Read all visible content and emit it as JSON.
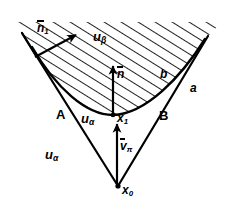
{
  "figure": {
    "background_color": "#ffffff",
    "ink_color": "#000000",
    "hatch_color": "#111111"
  },
  "labels": {
    "normal_1": {
      "base": "n",
      "sub": "1",
      "overbar": true
    },
    "u_beta": {
      "base": "u",
      "sub": "β",
      "overbar": false
    },
    "normal_n": {
      "base": "n",
      "sub": "",
      "overbar": true
    },
    "curve_b": {
      "base": "b",
      "sub": "",
      "overbar": false
    },
    "curve_a": {
      "base": "a",
      "sub": "",
      "overbar": false
    },
    "edge_A": {
      "base": "A",
      "sub": "",
      "overbar": false
    },
    "edge_B": {
      "base": "B",
      "sub": "",
      "overbar": false
    },
    "u_alpha_mid": {
      "base": "u",
      "sub": "α",
      "overbar": false
    },
    "u_alpha_low": {
      "base": "u",
      "sub": "α",
      "overbar": false
    },
    "point_x1": {
      "base": "x",
      "sub": "1",
      "overbar": false
    },
    "point_x0": {
      "base": "x",
      "sub": "0",
      "overbar": false
    },
    "velocity_v_pi": {
      "base": "v",
      "sub": "π",
      "overbar": true
    }
  },
  "geometry": {
    "vertex_x0": [
      118,
      186
    ],
    "point_x1": [
      113,
      114
    ],
    "left_edge_top": [
      22,
      33
    ],
    "right_edge_top": [
      208,
      36
    ],
    "curve_left_end": [
      32,
      47
    ],
    "curve_right_end": [
      205,
      39
    ],
    "hatch_angle_deg": 60,
    "hatch_spacing_px": 9
  }
}
